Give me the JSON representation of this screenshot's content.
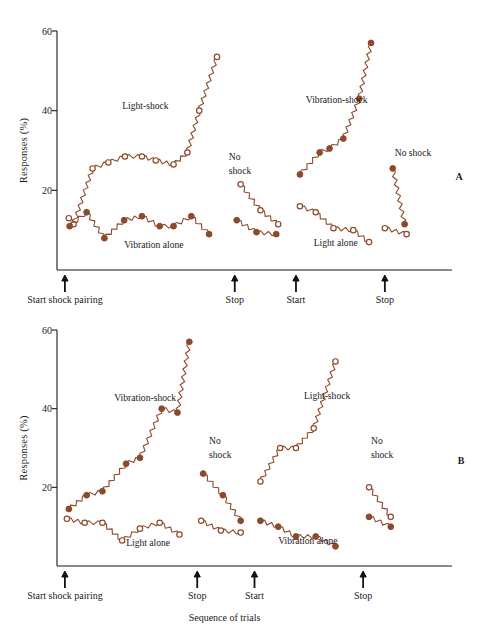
{
  "figure": {
    "title": "",
    "xlabel": "Sequence of trials",
    "ylabel": "Responses (%)",
    "accent_color": "#8B4A2B",
    "axis_color": "#1a1a1a"
  },
  "chart_data": [
    {
      "type": "line",
      "panel": "A",
      "panel_label": "A",
      "title": "",
      "xlabel": "",
      "ylabel": "Responses (%)",
      "ylim": [
        0,
        60
      ],
      "xlim": [
        0,
        100
      ],
      "yticks": [
        20,
        40,
        60
      ],
      "ytick_labels": [
        "20",
        "40",
        "60"
      ],
      "grid": false,
      "legend": "none",
      "zigzag_connector": true,
      "annotations": [
        {
          "text": "Light-shock",
          "x": 16.5,
          "y": 40.5
        },
        {
          "text": "Vibration alone",
          "x": 17.0,
          "y": 5.6
        },
        {
          "text": "No",
          "x": 43.5,
          "y": 27.5
        },
        {
          "text": "shock",
          "x": 43.5,
          "y": 24.0
        },
        {
          "text": "Vibration-shock",
          "x": 63.0,
          "y": 42.0
        },
        {
          "text": "Light alone",
          "x": 65.0,
          "y": 6.0
        },
        {
          "text": "No shock",
          "x": 85.5,
          "y": 28.5
        }
      ],
      "x_markers": [
        {
          "label": "Start shock pairing",
          "x": 2.0
        },
        {
          "label": "Stop",
          "x": 45.0
        },
        {
          "label": "Start",
          "x": 60.5
        },
        {
          "label": "Stop",
          "x": 83.0
        }
      ],
      "series": [
        {
          "name": "Light-shock",
          "marker": "open-circle",
          "color": "#8B4A2B",
          "x": [
            3.0,
            4.2,
            9.0,
            13.0,
            17.2,
            21.5,
            25.0,
            29.5,
            33.0,
            36.0,
            40.5
          ],
          "values": [
            13.0,
            11.5,
            25.5,
            27.0,
            28.5,
            28.5,
            27.5,
            26.5,
            29.5,
            40.0,
            53.5
          ]
        },
        {
          "name": "Vibration alone",
          "marker": "closed-circle",
          "color": "#8B4A2B",
          "x": [
            3.2,
            7.5,
            12.0,
            17.0,
            21.5,
            26.0,
            29.5,
            34.0,
            38.5
          ],
          "values": [
            11.0,
            14.5,
            8.0,
            12.5,
            13.5,
            11.0,
            11.0,
            13.5,
            9.0
          ]
        },
        {
          "name": "No shock (open)",
          "marker": "open-circle",
          "color": "#8B4A2B",
          "x": [
            46.5,
            51.5,
            56.0
          ],
          "values": [
            21.5,
            15.0,
            11.5
          ]
        },
        {
          "name": "No shock (closed)",
          "marker": "closed-circle",
          "color": "#8B4A2B",
          "x": [
            45.5,
            50.5,
            55.5
          ],
          "values": [
            12.5,
            9.5,
            9.0
          ]
        },
        {
          "name": "Vibration-shock",
          "marker": "closed-circle",
          "color": "#8B4A2B",
          "x": [
            61.5,
            66.5,
            69.0,
            72.5,
            76.5,
            79.5
          ],
          "values": [
            24.0,
            29.5,
            30.5,
            33.0,
            43.0,
            57.0
          ]
        },
        {
          "name": "Light alone",
          "marker": "open-circle",
          "color": "#8B4A2B",
          "x": [
            61.5,
            65.5,
            70.0,
            75.0,
            79.0
          ],
          "values": [
            16.0,
            14.5,
            10.5,
            10.0,
            7.0
          ]
        },
        {
          "name": "No shock 2 (closed)",
          "marker": "closed-circle",
          "color": "#8B4A2B",
          "x": [
            85.0,
            88.0
          ],
          "values": [
            25.5,
            11.5
          ]
        },
        {
          "name": "No shock 2 (open)",
          "marker": "open-circle",
          "color": "#8B4A2B",
          "x": [
            83.0,
            88.5
          ],
          "values": [
            10.5,
            9.0
          ]
        }
      ]
    },
    {
      "type": "line",
      "panel": "B",
      "panel_label": "B",
      "title": "",
      "xlabel": "Sequence of trials",
      "ylabel": "Responses (%)",
      "ylim": [
        0,
        60
      ],
      "xlim": [
        0,
        100
      ],
      "yticks": [
        20,
        40,
        60
      ],
      "ytick_labels": [
        "20",
        "40",
        "60"
      ],
      "grid": false,
      "legend": "none",
      "zigzag_connector": true,
      "annotations": [
        {
          "text": "Vibration-shock",
          "x": 14.5,
          "y": 42.0
        },
        {
          "text": "Light alone",
          "x": 17.5,
          "y": 5.0
        },
        {
          "text": "No",
          "x": 38.5,
          "y": 31.0
        },
        {
          "text": "shock",
          "x": 38.5,
          "y": 27.5
        },
        {
          "text": "Light-shock",
          "x": 62.5,
          "y": 42.5
        },
        {
          "text": "Vibration alone",
          "x": 56.0,
          "y": 5.5
        },
        {
          "text": "No",
          "x": 79.5,
          "y": 31.0
        },
        {
          "text": "shock",
          "x": 79.5,
          "y": 27.5
        }
      ],
      "x_markers": [
        {
          "label": "Start shock pairing",
          "x": 2.0
        },
        {
          "label": "Stop",
          "x": 35.5
        },
        {
          "label": "Start",
          "x": 50.0
        },
        {
          "label": "Stop",
          "x": 77.5
        }
      ],
      "series": [
        {
          "name": "Vibration-shock",
          "marker": "closed-circle",
          "color": "#8B4A2B",
          "x": [
            3.0,
            7.5,
            11.5,
            17.5,
            21.0,
            26.5,
            30.5,
            33.5
          ],
          "values": [
            14.5,
            18.0,
            19.0,
            26.0,
            27.5,
            40.0,
            39.0,
            57.0
          ]
        },
        {
          "name": "Light alone",
          "marker": "open-circle",
          "color": "#8B4A2B",
          "x": [
            2.5,
            7.0,
            11.5,
            16.5,
            21.0,
            26.0,
            31.0
          ],
          "values": [
            12.0,
            11.0,
            11.0,
            6.5,
            9.5,
            11.0,
            8.0
          ]
        },
        {
          "name": "No shock (closed)",
          "marker": "closed-circle",
          "color": "#8B4A2B",
          "x": [
            37.0,
            42.0,
            46.5
          ],
          "values": [
            23.5,
            18.0,
            11.5
          ]
        },
        {
          "name": "No shock (open)",
          "marker": "open-circle",
          "color": "#8B4A2B",
          "x": [
            36.5,
            41.5,
            46.5
          ],
          "values": [
            11.5,
            9.0,
            8.5
          ]
        },
        {
          "name": "Light-shock",
          "marker": "open-circle",
          "color": "#8B4A2B",
          "x": [
            51.5,
            56.5,
            60.5,
            65.0,
            70.5
          ],
          "values": [
            21.5,
            30.0,
            30.0,
            35.0,
            52.0
          ]
        },
        {
          "name": "Vibration alone",
          "marker": "closed-circle",
          "color": "#8B4A2B",
          "x": [
            51.5,
            56.0,
            60.5,
            65.5,
            70.5
          ],
          "values": [
            11.5,
            10.0,
            7.5,
            7.5,
            5.0
          ]
        },
        {
          "name": "No shock 2 (open)",
          "marker": "open-circle",
          "color": "#8B4A2B",
          "x": [
            79.0,
            84.5
          ],
          "values": [
            20.0,
            12.5
          ]
        },
        {
          "name": "No shock 2 (closed)",
          "marker": "closed-circle",
          "color": "#8B4A2B",
          "x": [
            79.0,
            84.5
          ],
          "values": [
            12.5,
            10.0
          ]
        }
      ]
    }
  ]
}
